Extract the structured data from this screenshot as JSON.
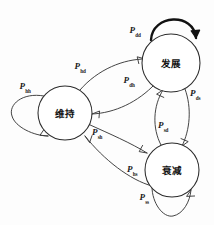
{
  "diagram": {
    "type": "markov-state-transition",
    "title": "",
    "background_color": "#fdfdfd",
    "stroke_color": "#3a3a3a",
    "nodes": [
      {
        "id": "d",
        "label": "发展",
        "cx": 171,
        "cy": 63,
        "r": 29
      },
      {
        "id": "h",
        "label": "维持",
        "cx": 65,
        "cy": 113,
        "r": 27
      },
      {
        "id": "s",
        "label": "衰减",
        "cx": 172,
        "cy": 170,
        "r": 27
      }
    ],
    "labels": [
      {
        "id": "p_dd",
        "symbol": "P",
        "subscript": "dd",
        "x": 135,
        "y": 31,
        "from": "d",
        "to": "d"
      },
      {
        "id": "p_hd",
        "symbol": "P",
        "subscript": "hd",
        "x": 80,
        "y": 67,
        "from": "h",
        "to": "d"
      },
      {
        "id": "p_dh",
        "symbol": "P",
        "subscript": "dh",
        "x": 129,
        "y": 81,
        "from": "d",
        "to": "h"
      },
      {
        "id": "p_hh",
        "symbol": "P",
        "subscript": "hh",
        "x": 25,
        "y": 87,
        "from": "h",
        "to": "h"
      },
      {
        "id": "p_ds",
        "symbol": "P",
        "subscript": "ds",
        "x": 195,
        "y": 94,
        "from": "d",
        "to": "s"
      },
      {
        "id": "p_sd",
        "symbol": "P",
        "subscript": "sd",
        "x": 163,
        "y": 126,
        "from": "s",
        "to": "d"
      },
      {
        "id": "p_sh",
        "symbol": "P",
        "subscript": "sh",
        "x": 97,
        "y": 133,
        "from": "s",
        "to": "h"
      },
      {
        "id": "p_hs",
        "symbol": "P",
        "subscript": "hs",
        "x": 132,
        "y": 170,
        "from": "h",
        "to": "s"
      },
      {
        "id": "p_ss",
        "symbol": "P",
        "subscript": "ss",
        "x": 144,
        "y": 198,
        "from": "s",
        "to": "s"
      }
    ],
    "edges": [
      {
        "id": "edge-dd-self",
        "from": "d",
        "to": "d",
        "style": "bold-self-loop-top"
      },
      {
        "id": "edge-hh-self",
        "from": "h",
        "to": "h",
        "style": "self-loop-left"
      },
      {
        "id": "edge-ss-self",
        "from": "s",
        "to": "s",
        "style": "self-loop-bottom"
      },
      {
        "id": "edge-hd",
        "from": "h",
        "to": "d",
        "style": "curve-up-right"
      },
      {
        "id": "edge-dh",
        "from": "d",
        "to": "h",
        "style": "curve-down-left"
      },
      {
        "id": "edge-hs",
        "from": "h",
        "to": "s",
        "style": "curve-down-right"
      },
      {
        "id": "edge-sh",
        "from": "s",
        "to": "h",
        "style": "curve-up-left"
      },
      {
        "id": "edge-ds",
        "from": "d",
        "to": "s",
        "style": "curve-right-down"
      },
      {
        "id": "edge-sd",
        "from": "s",
        "to": "d",
        "style": "curve-left-up"
      }
    ]
  }
}
